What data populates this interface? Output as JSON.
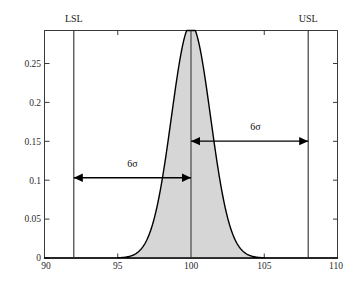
{
  "chart_data": {
    "type": "area",
    "title": "",
    "subtitle": "",
    "xlabel": "",
    "ylabel": "",
    "xlim": [
      90,
      110
    ],
    "ylim": [
      0,
      0.292
    ],
    "grid": false,
    "legend": null,
    "distribution": {
      "name": "normal",
      "mean": 100,
      "sigma": 1.3333,
      "peak_density": 0.2992,
      "fill_color": "#d6d6d6",
      "line_color": "#000000"
    },
    "x_ticks": [
      90,
      95,
      100,
      105,
      110
    ],
    "x_tick_labels": [
      "90",
      "95",
      "100",
      "105",
      "110"
    ],
    "y_ticks": [
      0,
      0.05,
      0.1,
      0.15,
      0.2,
      0.25
    ],
    "y_tick_labels": [
      "0",
      "0.05",
      "0.1",
      "0.15",
      "0.2",
      "0.25"
    ],
    "reference_lines": [
      {
        "id": "lsl",
        "label": "LSL",
        "x": 92,
        "color": "#2b2b2b"
      },
      {
        "id": "center",
        "label": "",
        "x": 100,
        "color": "#2b2b2b"
      },
      {
        "id": "usl",
        "label": "USL",
        "x": 108,
        "color": "#2b2b2b"
      }
    ],
    "annotations": [
      {
        "id": "sigma-left",
        "label": "6σ",
        "x_start": 92,
        "x_end": 100,
        "y": 0.103,
        "label_x": 96,
        "label_y": 0.117,
        "arrows": "both"
      },
      {
        "id": "sigma-right",
        "label": "6σ",
        "x_start": 100,
        "x_end": 108,
        "y": 0.15,
        "label_x": 104.4,
        "label_y": 0.164,
        "arrows": "both"
      }
    ]
  },
  "labels": {
    "lsl": "LSL",
    "usl": "USL",
    "sigma_left": "6σ",
    "sigma_right": "6σ",
    "x0": "90",
    "x1": "95",
    "x2": "100",
    "x3": "105",
    "x4": "110",
    "y0": "0",
    "y1": "0.05",
    "y2": "0.1",
    "y3": "0.15",
    "y4": "0.2",
    "y5": "0.25"
  }
}
